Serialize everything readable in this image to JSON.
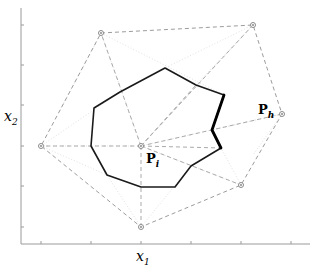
{
  "figure": {
    "axes": {
      "x_label": "x",
      "x_label_sub": "1",
      "y_label": "x",
      "y_label_sub": "2",
      "x_ticks_px": [
        41,
        91,
        141,
        191,
        241,
        291
      ],
      "y_ticks_px": [
        25,
        65,
        105,
        146,
        186,
        227
      ]
    },
    "labels": {
      "p_i": {
        "main": "P",
        "sub": "i"
      },
      "p_h": {
        "main": "P",
        "sub": "h"
      }
    },
    "points": [
      {
        "id": "top",
        "x": 101,
        "y": 33
      },
      {
        "id": "top-right",
        "x": 253,
        "y": 25
      },
      {
        "id": "P_h",
        "x": 282,
        "y": 114
      },
      {
        "id": "P_i",
        "x": 141,
        "y": 146
      },
      {
        "id": "left",
        "x": 41,
        "y": 146
      },
      {
        "id": "bottom-right",
        "x": 241,
        "y": 185
      },
      {
        "id": "bottom",
        "x": 141,
        "y": 227
      }
    ],
    "region_polygon": [
      [
        165,
        68
      ],
      [
        196,
        85
      ],
      [
        224,
        95
      ],
      [
        212,
        130
      ],
      [
        221,
        148
      ],
      [
        191,
        166
      ],
      [
        175,
        187
      ],
      [
        141,
        187
      ],
      [
        107,
        175
      ],
      [
        91,
        146
      ],
      [
        94,
        108
      ],
      [
        120,
        92
      ]
    ],
    "highlighted_edges": [
      [
        [
          224,
          95
        ],
        [
          212,
          130
        ]
      ],
      [
        [
          212,
          130
        ],
        [
          221,
          148
        ]
      ]
    ],
    "colors": {
      "region": "#1a1a1a",
      "hull": "#9c9c9c",
      "grid_faint": "#e2e2e2",
      "axis": "#9a9a9a"
    }
  }
}
